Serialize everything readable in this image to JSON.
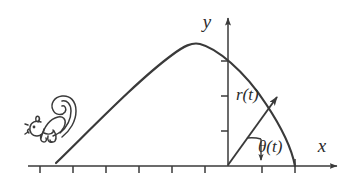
{
  "figure": {
    "caption_text": "",
    "type": "projectile-motion-polar-coordinates-diagram",
    "background_color": "#ffffff",
    "ink_color": "#3a3a3a",
    "label_color": "#2b2b2b"
  },
  "axes": {
    "x_axis": {
      "label": "x",
      "label_x": 322,
      "label_y": 146,
      "line_y": 166,
      "x_start": 28,
      "x_end": 341,
      "arrow": "right-arrowhead",
      "tick_count": 8,
      "tick_positions": [
        40,
        73,
        106,
        139,
        172,
        205,
        228,
        262,
        295
      ],
      "tick_length": 7
    },
    "y_axis": {
      "label": "y",
      "label_x": 207,
      "label_y": 22,
      "line_x": 228,
      "y_top": 14,
      "y_bottom": 166,
      "arrow": "up-arrowhead",
      "tick_count": 3,
      "tick_positions": [
        61,
        96,
        131
      ],
      "tick_length": 7
    },
    "origin": {
      "x": 228,
      "y": 166
    }
  },
  "trajectory": {
    "name": "parabolic-flight-path",
    "launch_point": {
      "x": 56,
      "y": 160
    },
    "apex_point": {
      "x": 196,
      "y": 43
    },
    "landing_point": {
      "x": 297,
      "y": 166
    },
    "stroke_width": 2.1
  },
  "vectors": {
    "position_vector": {
      "label": "r(t)",
      "label_x": 236,
      "label_y": 95,
      "from": {
        "x": 228,
        "y": 166
      },
      "to": {
        "x": 281,
        "y": 93
      },
      "arrowhead": "end",
      "stroke_width": 1.8
    },
    "angle": {
      "label": "θ(t)",
      "label_x": 258,
      "label_y": 146,
      "vertex": {
        "x": 228,
        "y": 166
      },
      "measured_from": "position-vector",
      "measured_to": "downward-vertical",
      "arc_radius": 38,
      "arc_arrowhead": "downward",
      "reference_arrow": {
        "from": {
          "x": 262,
          "y": 140
        },
        "to": {
          "x": 262,
          "y": 163
        }
      }
    }
  },
  "squirrel": {
    "name": "squirrel-launcher",
    "description": "hand-drawn squirrel at launch point",
    "bbox": {
      "x": 26,
      "y": 96,
      "width": 52,
      "height": 48
    }
  }
}
